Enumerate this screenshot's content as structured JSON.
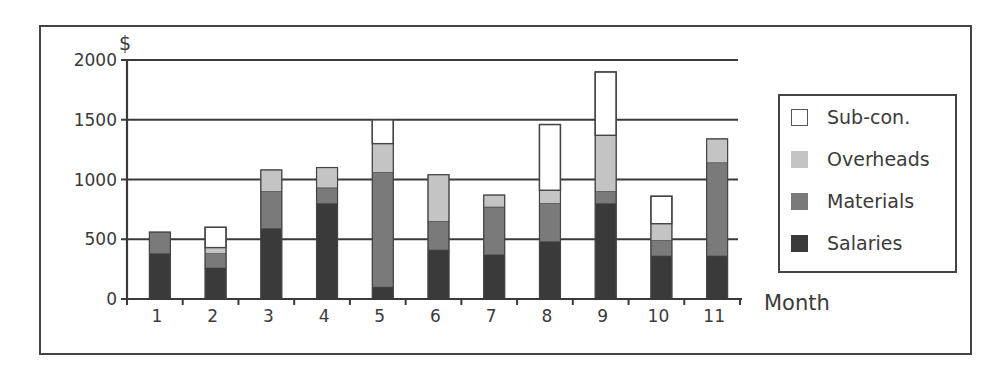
{
  "chart_data": {
    "type": "bar",
    "stacked": true,
    "title": "",
    "xlabel": "Month",
    "ylabel": "$",
    "ylim": [
      0,
      2000
    ],
    "yticks": [
      0,
      500,
      1000,
      1500,
      2000
    ],
    "grid": true,
    "legend_position": "right",
    "categories": [
      "1",
      "2",
      "3",
      "4",
      "5",
      "6",
      "7",
      "8",
      "9",
      "10",
      "11"
    ],
    "series": [
      {
        "name": "Salaries",
        "color": "#3a3a3a",
        "values": [
          380,
          260,
          590,
          800,
          100,
          410,
          370,
          480,
          800,
          360,
          360
        ]
      },
      {
        "name": "Materials",
        "color": "#7a7a7a",
        "values": [
          180,
          120,
          310,
          130,
          960,
          240,
          400,
          320,
          100,
          130,
          780
        ]
      },
      {
        "name": "Overheads",
        "color": "#c4c4c4",
        "values": [
          0,
          50,
          180,
          170,
          240,
          390,
          100,
          110,
          470,
          140,
          200
        ]
      },
      {
        "name": "Sub-con.",
        "color": "#ffffff",
        "values": [
          0,
          170,
          0,
          0,
          200,
          0,
          0,
          550,
          530,
          230,
          0
        ]
      }
    ],
    "totals": [
      560,
      600,
      1080,
      1100,
      1500,
      1040,
      870,
      1460,
      1900,
      860,
      1340
    ]
  },
  "legend": {
    "items": [
      {
        "label": "Sub-con.",
        "color": "#ffffff"
      },
      {
        "label": "Overheads",
        "color": "#c4c4c4"
      },
      {
        "label": "Materials",
        "color": "#7a7a7a"
      },
      {
        "label": "Salaries",
        "color": "#3a3a3a"
      }
    ]
  },
  "axes": {
    "y_title": "$",
    "x_title": "Month",
    "y_tick_labels": [
      "0",
      "500",
      "1000",
      "1500",
      "2000"
    ],
    "x_tick_labels": [
      "1",
      "2",
      "3",
      "4",
      "5",
      "6",
      "7",
      "8",
      "9",
      "10",
      "11"
    ]
  }
}
